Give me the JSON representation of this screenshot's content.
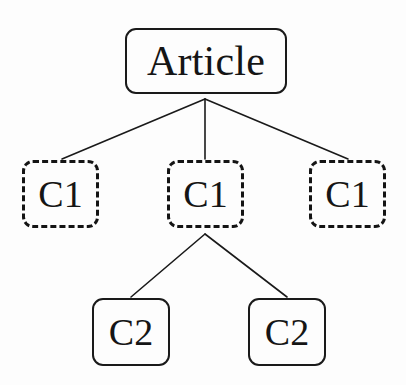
{
  "diagram": {
    "type": "tree",
    "background_color": "#fdfdfd",
    "stroke_color": "#1a1a1a",
    "text_color": "#151515",
    "nodes": [
      {
        "id": "root",
        "label": "Article",
        "level": 0,
        "border_style": "solid",
        "shape": "rounded-rectangle",
        "x": 125,
        "y": 28,
        "width": 162,
        "height": 66
      },
      {
        "id": "c1-a",
        "label": "C1",
        "level": 1,
        "border_style": "dashed",
        "shape": "rounded-rectangle",
        "x": 22,
        "y": 160,
        "width": 77,
        "height": 68
      },
      {
        "id": "c1-b",
        "label": "C1",
        "level": 1,
        "border_style": "dashed",
        "shape": "rounded-rectangle",
        "x": 167,
        "y": 160,
        "width": 77,
        "height": 68
      },
      {
        "id": "c1-c",
        "label": "C1",
        "level": 1,
        "border_style": "dashed",
        "shape": "rounded-rectangle",
        "x": 309,
        "y": 160,
        "width": 77,
        "height": 68
      },
      {
        "id": "c2-a",
        "label": "C2",
        "level": 2,
        "border_style": "solid",
        "shape": "rounded-rectangle",
        "x": 92,
        "y": 298,
        "width": 78,
        "height": 68
      },
      {
        "id": "c2-b",
        "label": "C2",
        "level": 2,
        "border_style": "solid",
        "shape": "rounded-rectangle",
        "x": 248,
        "y": 298,
        "width": 78,
        "height": 68
      }
    ],
    "edges": [
      {
        "from": "root",
        "to": "c1-a",
        "x1": 205,
        "y1": 99,
        "x2": 62,
        "y2": 159
      },
      {
        "from": "root",
        "to": "c1-b",
        "x1": 205,
        "y1": 99,
        "x2": 205,
        "y2": 159
      },
      {
        "from": "root",
        "to": "c1-c",
        "x1": 205,
        "y1": 99,
        "x2": 348,
        "y2": 159
      },
      {
        "from": "c1-b",
        "to": "c2-a",
        "x1": 205,
        "y1": 234,
        "x2": 131,
        "y2": 297
      },
      {
        "from": "c1-b",
        "to": "c2-b",
        "x1": 205,
        "y1": 234,
        "x2": 287,
        "y2": 297
      }
    ]
  }
}
